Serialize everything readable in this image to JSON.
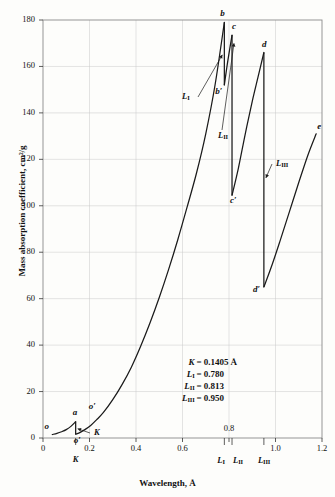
{
  "figure": {
    "xlabel": "Wavelength, Å",
    "ylabel": "Mass absorption coefficient, cm²/g"
  },
  "axes": {
    "x_ticks": [
      {
        "value": 0,
        "label": "0"
      },
      {
        "value": 0.2,
        "label": "0.2"
      },
      {
        "value": 0.4,
        "label": "0.4"
      },
      {
        "value": 0.6,
        "label": "0.6"
      },
      {
        "value": 0.8,
        "label": "0.8"
      },
      {
        "value": 1.0,
        "label": "1.0"
      },
      {
        "value": 1.2,
        "label": "1.2"
      }
    ],
    "y_ticks": [
      {
        "value": 0,
        "label": "0"
      },
      {
        "value": 20,
        "label": "20"
      },
      {
        "value": 40,
        "label": "40"
      },
      {
        "value": 60,
        "label": "60"
      },
      {
        "value": 80,
        "label": "80"
      },
      {
        "value": 100,
        "label": "100"
      },
      {
        "value": 120,
        "label": "120"
      },
      {
        "value": 140,
        "label": "140"
      },
      {
        "value": 160,
        "label": "160"
      },
      {
        "value": 180,
        "label": "180"
      }
    ]
  },
  "edge_markers_below_axis": [
    {
      "name": "K",
      "base": "K",
      "sub": "",
      "value": 0.1405
    },
    {
      "name": "L-I",
      "base": "L",
      "sub": "I",
      "value": 0.78
    },
    {
      "name": "L-II",
      "base": "L",
      "sub": "II",
      "value": 0.813
    },
    {
      "name": "L-III",
      "base": "L",
      "sub": "III",
      "value": 0.95
    }
  ],
  "edge_callouts": [
    {
      "name": "L-I",
      "base": "L",
      "sub": "I",
      "text": "L₁"
    },
    {
      "name": "L-II",
      "base": "L",
      "sub": "II",
      "text": "L₂"
    },
    {
      "name": "L-III",
      "base": "L",
      "sub": "III",
      "text": "L₃"
    },
    {
      "name": "K",
      "base": "K",
      "sub": "",
      "text": "K"
    }
  ],
  "curve_point_labels": [
    {
      "id": "o",
      "text": "o",
      "x": 0.045,
      "y": 2.0
    },
    {
      "id": "a",
      "text": "a",
      "x": 0.1405,
      "y": 7.0
    },
    {
      "id": "ap",
      "text": "o′",
      "x": 0.1405,
      "y": 1.6
    },
    {
      "id": "op",
      "text": "o′",
      "x": 0.205,
      "y": 9.5
    },
    {
      "id": "b",
      "text": "b",
      "x": 0.78,
      "y": 179.0
    },
    {
      "id": "bp",
      "text": "b′",
      "x": 0.78,
      "y": 152.0
    },
    {
      "id": "c",
      "text": "c",
      "x": 0.813,
      "y": 173.5
    },
    {
      "id": "cp",
      "text": "c′",
      "x": 0.813,
      "y": 104.5
    },
    {
      "id": "d",
      "text": "d",
      "x": 0.95,
      "y": 166.0
    },
    {
      "id": "dp",
      "text": "d′",
      "x": 0.95,
      "y": 65.0
    },
    {
      "id": "e",
      "text": "e",
      "x": 1.175,
      "y": 131.0
    }
  ],
  "legend_box": {
    "rows": [
      {
        "symbol": "K",
        "sub": "",
        "eq": "=",
        "value": "0.1405",
        "unit": "Å"
      },
      {
        "symbol": "L",
        "sub": "I",
        "eq": "=",
        "value": "0.780",
        "unit": ""
      },
      {
        "symbol": "L",
        "sub": "II",
        "eq": "=",
        "value": "0.813",
        "unit": ""
      },
      {
        "symbol": "L",
        "sub": "III",
        "eq": "=",
        "value": "0.950",
        "unit": ""
      }
    ]
  },
  "chart_data": {
    "type": "line",
    "title": "",
    "xlabel": "Wavelength, Å",
    "ylabel": "Mass absorption coefficient, cm²/g",
    "xlim": [
      0,
      1.2
    ],
    "ylim": [
      0,
      180
    ],
    "xtick_step": 0.2,
    "ytick_step": 20,
    "grid": true,
    "legend": "none",
    "annotations": [
      "K = 0.1405 Å",
      "L_I = 0.780",
      "L_II = 0.813",
      "L_III = 0.950"
    ],
    "absorption_edges": [
      {
        "label": "K",
        "wavelength": 0.1405,
        "mu_before": 7.0,
        "mu_after": 1.6
      },
      {
        "label": "L_I",
        "wavelength": 0.78,
        "mu_before": 179.0,
        "mu_after": 152.0
      },
      {
        "label": "L_II",
        "wavelength": 0.813,
        "mu_before": 173.5,
        "mu_after": 104.5
      },
      {
        "label": "L_III",
        "wavelength": 0.95,
        "mu_before": 166.0,
        "mu_after": 65.0
      }
    ],
    "segments": [
      {
        "name": "below-K",
        "points": [
          [
            0.04,
            1.5
          ],
          [
            0.06,
            2.0
          ],
          [
            0.08,
            2.7
          ],
          [
            0.1,
            3.6
          ],
          [
            0.12,
            5.0
          ],
          [
            0.1405,
            7.0
          ]
        ]
      },
      {
        "name": "K-to-LI",
        "points": [
          [
            0.1405,
            1.6
          ],
          [
            0.16,
            2.4
          ],
          [
            0.18,
            3.6
          ],
          [
            0.205,
            5.4
          ],
          [
            0.23,
            7.8
          ],
          [
            0.26,
            11.0
          ],
          [
            0.3,
            16.5
          ],
          [
            0.34,
            23.0
          ],
          [
            0.38,
            30.5
          ],
          [
            0.42,
            39.5
          ],
          [
            0.46,
            49.5
          ],
          [
            0.5,
            60.5
          ],
          [
            0.54,
            72.5
          ],
          [
            0.58,
            85.5
          ],
          [
            0.62,
            99.5
          ],
          [
            0.66,
            114.0
          ],
          [
            0.7,
            131.0
          ],
          [
            0.74,
            152.0
          ],
          [
            0.78,
            179.0
          ]
        ]
      },
      {
        "name": "LI-to-LII",
        "points": [
          [
            0.78,
            152.0
          ],
          [
            0.795,
            162.5
          ],
          [
            0.813,
            173.5
          ]
        ]
      },
      {
        "name": "LII-to-LIII",
        "points": [
          [
            0.813,
            104.5
          ],
          [
            0.84,
            116.0
          ],
          [
            0.87,
            131.0
          ],
          [
            0.9,
            145.0
          ],
          [
            0.925,
            155.5
          ],
          [
            0.95,
            166.0
          ]
        ]
      },
      {
        "name": "above-LIII",
        "points": [
          [
            0.95,
            65.0
          ],
          [
            0.985,
            74.5
          ],
          [
            1.02,
            85.0
          ],
          [
            1.06,
            97.5
          ],
          [
            1.1,
            110.0
          ],
          [
            1.14,
            122.0
          ],
          [
            1.175,
            131.0
          ]
        ]
      }
    ]
  }
}
